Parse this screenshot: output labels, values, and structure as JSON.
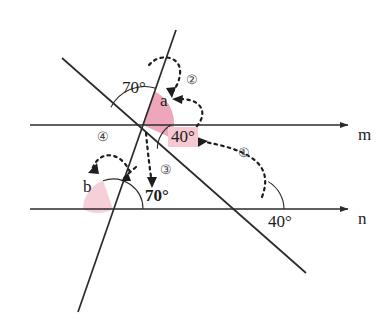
{
  "figure": {
    "background": "#ffffff",
    "stroke_color": "#2b2b2b",
    "highlight_color": "#f6c8d2",
    "wedge_fill": "#f2aabb",
    "wedge_fill_light": "#f7cdd6",
    "dashed_color": "#1d1d1d"
  },
  "lines": {
    "m": {
      "label": "m",
      "y": 125,
      "x_start": 30,
      "x_end": 348,
      "label_x": 358,
      "label_y": 126
    },
    "n": {
      "label": "n",
      "y": 209,
      "x_start": 30,
      "x_end": 348,
      "label_x": 358,
      "label_y": 210
    },
    "transversal_steep": {
      "x1": 176,
      "y1": 30,
      "x2": 78,
      "y2": 312
    },
    "transversal_slanted": {
      "x1": 62,
      "y1": 58,
      "x2": 306,
      "y2": 273
    }
  },
  "vertices": {
    "on_m": {
      "x": 143,
      "y": 125
    },
    "steep_on_n": {
      "x": 113,
      "y": 209
    },
    "slanted_on_n": {
      "x": 252,
      "y": 209
    }
  },
  "angle_labels": [
    {
      "id": "angle-70-top",
      "text": "70°",
      "x": 122,
      "y": 79,
      "bold": false,
      "highlighted": false
    },
    {
      "id": "angle-a",
      "text": "a",
      "x": 160,
      "y": 92,
      "bold": false,
      "highlighted": false
    },
    {
      "id": "angle-40-on-m",
      "text": "40°",
      "x": 171,
      "y": 128,
      "bold": false,
      "highlighted": true
    },
    {
      "id": "angle-b",
      "text": "b",
      "x": 83,
      "y": 178,
      "bold": false,
      "highlighted": false
    },
    {
      "id": "angle-70-on-n",
      "text": "70°",
      "x": 145,
      "y": 187,
      "bold": true,
      "highlighted": false
    },
    {
      "id": "angle-40-on-n",
      "text": "40°",
      "x": 268,
      "y": 213,
      "bold": false,
      "highlighted": false
    }
  ],
  "step_markers": [
    {
      "id": "step-1",
      "text": "①",
      "x": 238,
      "y": 146
    },
    {
      "id": "step-2",
      "text": "②",
      "x": 186,
      "y": 73
    },
    {
      "id": "step-3",
      "text": "③",
      "x": 160,
      "y": 163
    },
    {
      "id": "step-4",
      "text": "④",
      "x": 97,
      "y": 130
    }
  ],
  "reasoning_arrows": [
    {
      "id": "arrow-1",
      "from": "angle-40-on-n",
      "to": "angle-40-on-m"
    },
    {
      "id": "arrow-2",
      "from": "angle-40-on-m",
      "to": "angle-a"
    },
    {
      "id": "arrow-3",
      "from": "vertex-on-m",
      "to": "angle-70-on-n"
    },
    {
      "id": "arrow-4",
      "from": "angle-70-on-n",
      "to": "angle-b"
    }
  ],
  "highlight_boxes": [
    {
      "id": "highlight-40-on-m",
      "x": 168,
      "y": 127,
      "w": 30,
      "h": 20
    }
  ]
}
